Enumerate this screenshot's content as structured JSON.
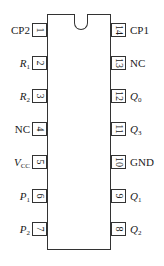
{
  "diagram": {
    "type": "ic-pinout-dip14",
    "left_pins": [
      {
        "number": "1",
        "label_main": "CP2",
        "label_sub": "",
        "italic": false
      },
      {
        "number": "2",
        "label_main": "R",
        "label_sub": "1",
        "italic": true
      },
      {
        "number": "3",
        "label_main": "R",
        "label_sub": "2",
        "italic": true
      },
      {
        "number": "4",
        "label_main": "NC",
        "label_sub": "",
        "italic": false
      },
      {
        "number": "5",
        "label_main": "V",
        "label_sub": "CC",
        "italic": true
      },
      {
        "number": "6",
        "label_main": "P",
        "label_sub": "1",
        "italic": true
      },
      {
        "number": "7",
        "label_main": "P",
        "label_sub": "2",
        "italic": true
      }
    ],
    "right_pins": [
      {
        "number": "14",
        "label_main": "CP1",
        "label_sub": "",
        "italic": false
      },
      {
        "number": "13",
        "label_main": "NC",
        "label_sub": "",
        "italic": false
      },
      {
        "number": "12",
        "label_main": "Q",
        "label_sub": "0",
        "italic": true
      },
      {
        "number": "11",
        "label_main": "Q",
        "label_sub": "3",
        "italic": true
      },
      {
        "number": "10",
        "label_main": "GND",
        "label_sub": "",
        "italic": false
      },
      {
        "number": "9",
        "label_main": "Q",
        "label_sub": "1",
        "italic": true
      },
      {
        "number": "8",
        "label_main": "Q",
        "label_sub": "2",
        "italic": true
      }
    ],
    "colors": {
      "outline": "#333333",
      "text": "#1a1a1a",
      "background": "#ffffff"
    }
  }
}
